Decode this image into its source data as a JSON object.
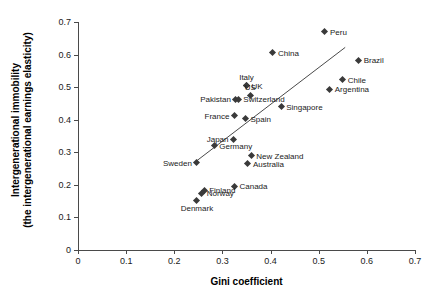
{
  "chart_data": {
    "type": "scatter",
    "title": "",
    "xlabel": "Gini coefficient",
    "ylabel_line1": "Intergenerational immobility",
    "ylabel_line2": "(the intergenerational earnings elasticity)",
    "xlim": [
      0,
      0.7
    ],
    "ylim": [
      0,
      0.7
    ],
    "xticks": [
      "0",
      "0.1",
      "0.2",
      "0.3",
      "0.4",
      "0.5",
      "0.6",
      "0.7"
    ],
    "xtick_values": [
      0,
      0.1,
      0.2,
      0.3,
      0.4,
      0.5,
      0.6,
      0.7
    ],
    "yticks": [
      "0",
      "0.1",
      "0.2",
      "0.3",
      "0.4",
      "0.5",
      "0.6",
      "0.7"
    ],
    "ytick_values": [
      0,
      0.1,
      0.2,
      0.3,
      0.4,
      0.5,
      0.6,
      0.7
    ],
    "grid": false,
    "legend": "none",
    "marker_color": "#3a3a3a",
    "axis_color": "#4a4a4a",
    "trend_line": {
      "x_start": 0.245,
      "y_start": 0.272,
      "x_end": 0.555,
      "y_end": 0.622
    },
    "points": [
      {
        "label": "Peru",
        "x": 0.513,
        "y": 0.67,
        "label_pos": "right"
      },
      {
        "label": "China",
        "x": 0.405,
        "y": 0.605,
        "label_pos": "right"
      },
      {
        "label": "Brazil",
        "x": 0.583,
        "y": 0.583,
        "label_pos": "right"
      },
      {
        "label": "Chile",
        "x": 0.55,
        "y": 0.523,
        "label_pos": "right"
      },
      {
        "label": "Italy",
        "x": 0.35,
        "y": 0.505,
        "label_pos": "above"
      },
      {
        "label": "UK",
        "x": 0.35,
        "y": 0.505,
        "label_pos": "right"
      },
      {
        "label": "Argentina",
        "x": 0.523,
        "y": 0.493,
        "label_pos": "right"
      },
      {
        "label": "US",
        "x": 0.358,
        "y": 0.473,
        "label_pos": "above"
      },
      {
        "label": "Pakistan",
        "x": 0.328,
        "y": 0.463,
        "label_pos": "left"
      },
      {
        "label": "Switzerland",
        "x": 0.333,
        "y": 0.463,
        "label_pos": "right"
      },
      {
        "label": "Singapore",
        "x": 0.422,
        "y": 0.44,
        "label_pos": "right"
      },
      {
        "label": "France",
        "x": 0.325,
        "y": 0.412,
        "label_pos": "left"
      },
      {
        "label": "Spain",
        "x": 0.348,
        "y": 0.403,
        "label_pos": "right"
      },
      {
        "label": "Japan",
        "x": 0.323,
        "y": 0.34,
        "label_pos": "left"
      },
      {
        "label": "Germany",
        "x": 0.283,
        "y": 0.32,
        "label_pos": "right"
      },
      {
        "label": "New Zealand",
        "x": 0.36,
        "y": 0.29,
        "label_pos": "right"
      },
      {
        "label": "Sweden",
        "x": 0.247,
        "y": 0.268,
        "label_pos": "left"
      },
      {
        "label": "Australia",
        "x": 0.353,
        "y": 0.265,
        "label_pos": "right"
      },
      {
        "label": "Canada",
        "x": 0.325,
        "y": 0.195,
        "label_pos": "right"
      },
      {
        "label": "Finland",
        "x": 0.262,
        "y": 0.183,
        "label_pos": "right"
      },
      {
        "label": "Norway",
        "x": 0.257,
        "y": 0.174,
        "label_pos": "right"
      },
      {
        "label": "Denmark",
        "x": 0.247,
        "y": 0.153,
        "label_pos": "below"
      }
    ]
  }
}
